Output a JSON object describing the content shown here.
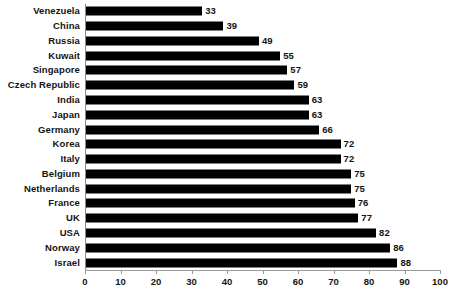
{
  "chart_data": {
    "type": "bar",
    "orientation": "horizontal",
    "title": "",
    "subtitle": "",
    "xlabel": "",
    "ylabel": "",
    "xlim": [
      0,
      100
    ],
    "xticks": [
      0,
      10,
      20,
      30,
      40,
      50,
      60,
      70,
      80,
      90,
      100
    ],
    "grid": false,
    "legend": null,
    "bar_color": "#000000",
    "axis_color": "#9a9a9a",
    "text_color": "#141414",
    "show_value_labels": true,
    "categories": [
      "Venezuela",
      "China",
      "Russia",
      "Kuwait",
      "Singapore",
      "Czech Republic",
      "India",
      "Japan",
      "Germany",
      "Korea",
      "Italy",
      "Belgium",
      "Netherlands",
      "France",
      "UK",
      "USA",
      "Norway",
      "Israel"
    ],
    "values": [
      33,
      39,
      49,
      55,
      57,
      59,
      63,
      63,
      66,
      72,
      72,
      75,
      75,
      76,
      77,
      82,
      86,
      88
    ]
  }
}
